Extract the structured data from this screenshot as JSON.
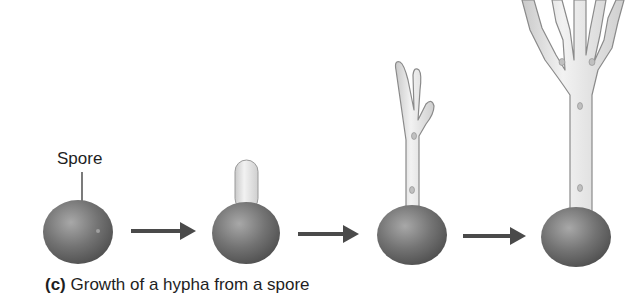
{
  "figure": {
    "spore_label": "Spore",
    "caption": {
      "panel_letter": "(c)",
      "text": "Growth of a hypha from a spore"
    },
    "stages": [
      {
        "name": "spore",
        "description": "Single spore"
      },
      {
        "name": "germinating-spore",
        "description": "Spore with short germ tube"
      },
      {
        "name": "young-hypha",
        "description": "Hypha with few branches"
      },
      {
        "name": "branched-hypha",
        "description": "Hypha with multiple branches"
      }
    ],
    "colors": {
      "spore": "#6e6e6e",
      "hypha": "#e4e4e4",
      "hypha_outline": "#8a8a8a",
      "arrow": "#4a4a4a",
      "text": "#1e1e1e"
    }
  }
}
